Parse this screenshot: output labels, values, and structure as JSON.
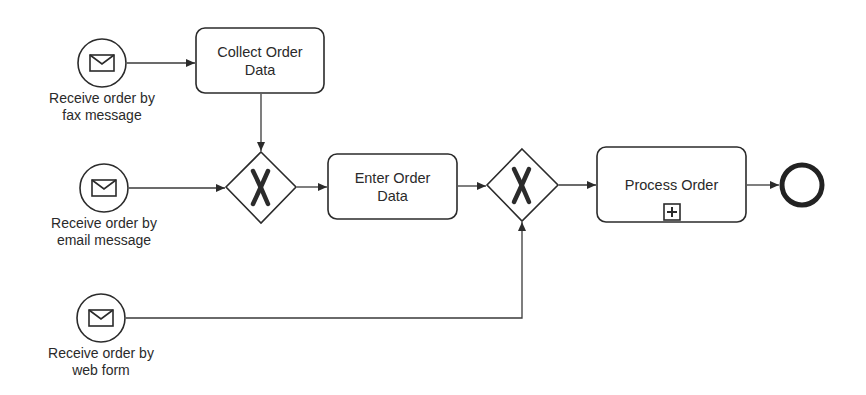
{
  "diagram": {
    "type": "BPMN process",
    "start_events": [
      {
        "id": "start_fax",
        "kind": "message-start-event",
        "label_line1": "Receive order by",
        "label_line2": "fax message"
      },
      {
        "id": "start_email",
        "kind": "message-start-event",
        "label_line1": "Receive order by",
        "label_line2": "email message"
      },
      {
        "id": "start_web",
        "kind": "message-start-event",
        "label_line1": "Receive order by",
        "label_line2": "web form"
      }
    ],
    "tasks": [
      {
        "id": "collect",
        "label_line1": "Collect Order",
        "label_line2": "Data"
      },
      {
        "id": "enter",
        "label_line1": "Enter Order",
        "label_line2": "Data"
      },
      {
        "id": "process",
        "label_line1": "Process Order",
        "label_line2": "",
        "marker": "collapsed-subprocess-plus"
      }
    ],
    "gateways": [
      {
        "id": "xor1",
        "kind": "exclusive-gateway",
        "symbol": "X"
      },
      {
        "id": "xor2",
        "kind": "exclusive-gateway",
        "symbol": "X"
      }
    ],
    "end_events": [
      {
        "id": "end",
        "kind": "end-event"
      }
    ],
    "flows": [
      {
        "from": "start_fax",
        "to": "collect"
      },
      {
        "from": "collect",
        "to": "xor1"
      },
      {
        "from": "start_email",
        "to": "xor1"
      },
      {
        "from": "xor1",
        "to": "enter"
      },
      {
        "from": "enter",
        "to": "xor2"
      },
      {
        "from": "start_web",
        "to": "xor2"
      },
      {
        "from": "xor2",
        "to": "process"
      },
      {
        "from": "process",
        "to": "end"
      }
    ],
    "colors": {
      "stroke": "#2b2b2b",
      "fill": "#ffffff",
      "text": "#2a2a2a"
    }
  }
}
